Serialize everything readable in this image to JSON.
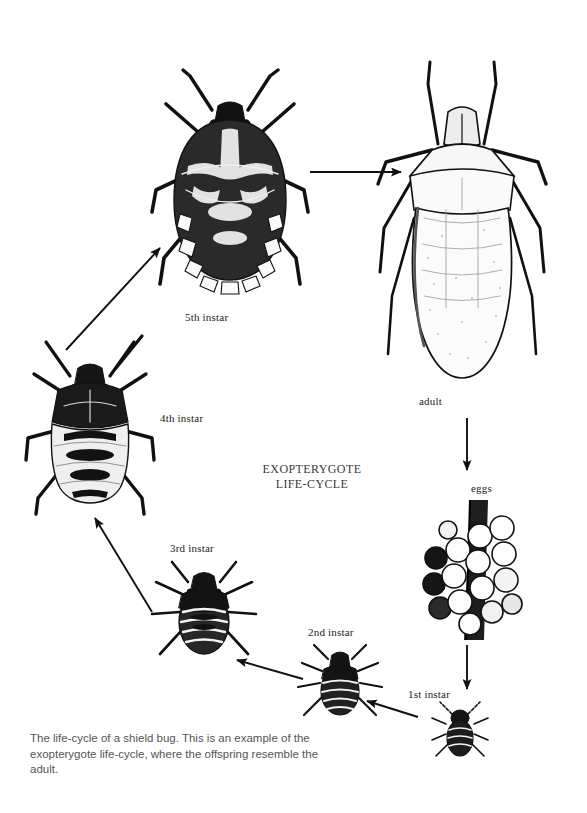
{
  "diagram": {
    "title_line1": "EXOPTERYGOTE",
    "title_line2": "LIFE-CYCLE",
    "caption": "The life-cycle of a shield bug. This is an example of the exopterygote life-cycle, where the offspring resemble the adult.",
    "ink_color": "#111111",
    "background_color": "#ffffff",
    "stages": [
      {
        "id": "fifth-instar",
        "label": "5th instar"
      },
      {
        "id": "adult",
        "label": "adult"
      },
      {
        "id": "eggs",
        "label": "eggs"
      },
      {
        "id": "first-instar",
        "label": "1st instar"
      },
      {
        "id": "second-instar",
        "label": "2nd instar"
      },
      {
        "id": "third-instar",
        "label": "3rd instar"
      },
      {
        "id": "fourth-instar",
        "label": "4th instar"
      }
    ],
    "arrows": [
      {
        "id": "arrow-fifth-to-adult",
        "direction": "right"
      },
      {
        "id": "arrow-adult-to-eggs",
        "direction": "down"
      },
      {
        "id": "arrow-eggs-to-first",
        "direction": "down"
      },
      {
        "id": "arrow-first-to-second",
        "direction": "left"
      },
      {
        "id": "arrow-second-to-third",
        "direction": "up-left"
      },
      {
        "id": "arrow-third-to-fourth",
        "direction": "up-left"
      },
      {
        "id": "arrow-fourth-to-fifth",
        "direction": "up-right"
      }
    ]
  }
}
